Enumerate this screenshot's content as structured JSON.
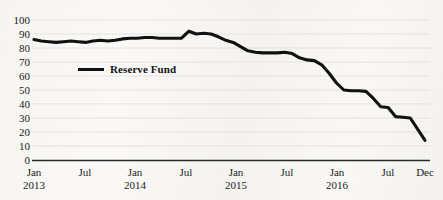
{
  "chart_data": {
    "type": "line",
    "title": "",
    "xlabel": "",
    "ylabel": "",
    "ylim": [
      0,
      100
    ],
    "yticks": [
      0,
      10,
      20,
      30,
      40,
      50,
      60,
      70,
      80,
      90,
      100
    ],
    "grid": true,
    "legend_position": "inside-upper-left",
    "xticks": [
      {
        "label": "Jan",
        "year": "2013"
      },
      {
        "label": "Jul",
        "year": ""
      },
      {
        "label": "Jan",
        "year": "2014"
      },
      {
        "label": "Jul",
        "year": ""
      },
      {
        "label": "Jan",
        "year": "2015"
      },
      {
        "label": "Jul",
        "year": ""
      },
      {
        "label": "Jan",
        "year": "2016"
      },
      {
        "label": "Jul",
        "year": ""
      },
      {
        "label": "Dec",
        "year": ""
      }
    ],
    "x": [
      "2013-01",
      "2013-02",
      "2013-03",
      "2013-04",
      "2013-05",
      "2013-06",
      "2013-07",
      "2013-08",
      "2013-09",
      "2013-10",
      "2013-11",
      "2013-12",
      "2014-01",
      "2014-02",
      "2014-03",
      "2014-04",
      "2014-05",
      "2014-06",
      "2014-07",
      "2014-08",
      "2014-09",
      "2014-10",
      "2014-11",
      "2014-12",
      "2015-01",
      "2015-02",
      "2015-03",
      "2015-04",
      "2015-05",
      "2015-06",
      "2015-07",
      "2015-08",
      "2015-09",
      "2015-10",
      "2015-11",
      "2015-12",
      "2016-01",
      "2016-02",
      "2016-03",
      "2016-04",
      "2016-05",
      "2016-06",
      "2016-07",
      "2016-08",
      "2016-09",
      "2016-10",
      "2016-11",
      "2016-12"
    ],
    "series": [
      {
        "name": "Reserve Fund",
        "color": "#111111",
        "values": [
          86,
          85,
          84.5,
          84,
          84.5,
          85,
          84.5,
          84,
          85,
          85.5,
          85,
          85.5,
          86.5,
          87,
          87,
          87.5,
          87.5,
          87,
          87,
          87,
          87,
          92,
          90,
          90.5,
          90,
          88,
          85.5,
          84,
          81,
          78,
          77,
          76.5,
          76.5,
          76.5,
          77,
          76,
          73,
          71.5,
          71,
          68,
          62,
          55,
          50,
          49.5,
          49.5,
          49,
          44,
          38
        ]
      }
    ],
    "extra_points": {
      "note": "tail continues 2016 through December",
      "tail_values": [
        37.5,
        31,
        30.5,
        30,
        22,
        14
      ]
    },
    "legend": [
      {
        "label": "Reserve Fund",
        "swatch": "line-swatch",
        "color": "#111111"
      }
    ]
  },
  "axis": {
    "baseline_color": "#2a2a2a",
    "gridline_color": "#e2e0dc",
    "tick_text_color": "#1b1b1b"
  }
}
